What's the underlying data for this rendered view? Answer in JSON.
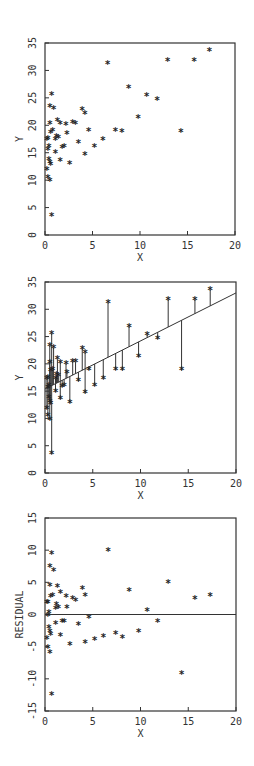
{
  "chart_data": [
    {
      "type": "scatter",
      "title": "",
      "xlabel": "X",
      "ylabel": "Y",
      "xlim": [
        0,
        20
      ],
      "ylim": [
        0,
        35
      ],
      "xticks": [
        0,
        5,
        10,
        15,
        20
      ],
      "yticks": [
        0,
        5,
        10,
        15,
        20,
        25,
        30,
        35
      ],
      "grid": false,
      "marker": "*",
      "points": [
        [
          0.7,
          25.5
        ],
        [
          0.5,
          23.3
        ],
        [
          0.9,
          22.9
        ],
        [
          1.3,
          20.8
        ],
        [
          0.5,
          20.2
        ],
        [
          0.8,
          18.9
        ],
        [
          0.6,
          18.6
        ],
        [
          0.3,
          17.5
        ],
        [
          1.2,
          17.9
        ],
        [
          1.4,
          17.7
        ],
        [
          1.1,
          17.3
        ],
        [
          0.2,
          17.3
        ],
        [
          0.4,
          16.0
        ],
        [
          0.3,
          15.5
        ],
        [
          1.1,
          14.9
        ],
        [
          0.4,
          13.7
        ],
        [
          0.5,
          13.1
        ],
        [
          0.6,
          12.7
        ],
        [
          0.2,
          11.8
        ],
        [
          0.3,
          10.4
        ],
        [
          0.5,
          9.8
        ],
        [
          0.7,
          3.5
        ],
        [
          1.6,
          20.2
        ],
        [
          2.2,
          20.0
        ],
        [
          2.9,
          20.4
        ],
        [
          3.2,
          20.3
        ],
        [
          3.9,
          22.8
        ],
        [
          4.2,
          22.0
        ],
        [
          4.6,
          18.9
        ],
        [
          2.3,
          18.4
        ],
        [
          3.5,
          16.8
        ],
        [
          2.0,
          16.0
        ],
        [
          1.8,
          15.8
        ],
        [
          5.2,
          16.0
        ],
        [
          4.2,
          14.6
        ],
        [
          1.6,
          13.5
        ],
        [
          2.6,
          12.9
        ],
        [
          6.1,
          17.3
        ],
        [
          6.6,
          31.1
        ],
        [
          8.8,
          26.8
        ],
        [
          10.7,
          25.3
        ],
        [
          11.8,
          24.6
        ],
        [
          9.8,
          21.3
        ],
        [
          7.4,
          18.9
        ],
        [
          8.1,
          18.8
        ],
        [
          14.3,
          18.8
        ],
        [
          12.9,
          31.7
        ],
        [
          15.7,
          31.7
        ],
        [
          17.3,
          33.5
        ]
      ]
    },
    {
      "type": "scatter",
      "title": "",
      "xlabel": "X",
      "ylabel": "Y",
      "xlim": [
        0,
        20
      ],
      "ylim": [
        0,
        35
      ],
      "xticks": [
        0,
        5,
        10,
        15,
        20
      ],
      "yticks": [
        0,
        5,
        10,
        15,
        20,
        25,
        30,
        35
      ],
      "grid": false,
      "marker": "*",
      "fit_line": {
        "intercept": 15.4,
        "slope": 0.88
      },
      "residual_segments": true,
      "points": "same as chart 1"
    },
    {
      "type": "scatter",
      "title": "",
      "xlabel": "X",
      "ylabel": "RESIDUAL",
      "xlim": [
        0,
        20
      ],
      "ylim": [
        -15,
        15
      ],
      "xticks": [
        0,
        5,
        10,
        15,
        20
      ],
      "yticks": [
        -15,
        -10,
        -5,
        0,
        5,
        10,
        15
      ],
      "grid": false,
      "marker": "*",
      "reference_line": 0,
      "points": "residuals of chart 1 points: y - (15.4 + 0.88 x)"
    }
  ],
  "labels": {
    "x": "X",
    "y": "Y",
    "residual": "RESIDUAL",
    "marker": "*"
  }
}
